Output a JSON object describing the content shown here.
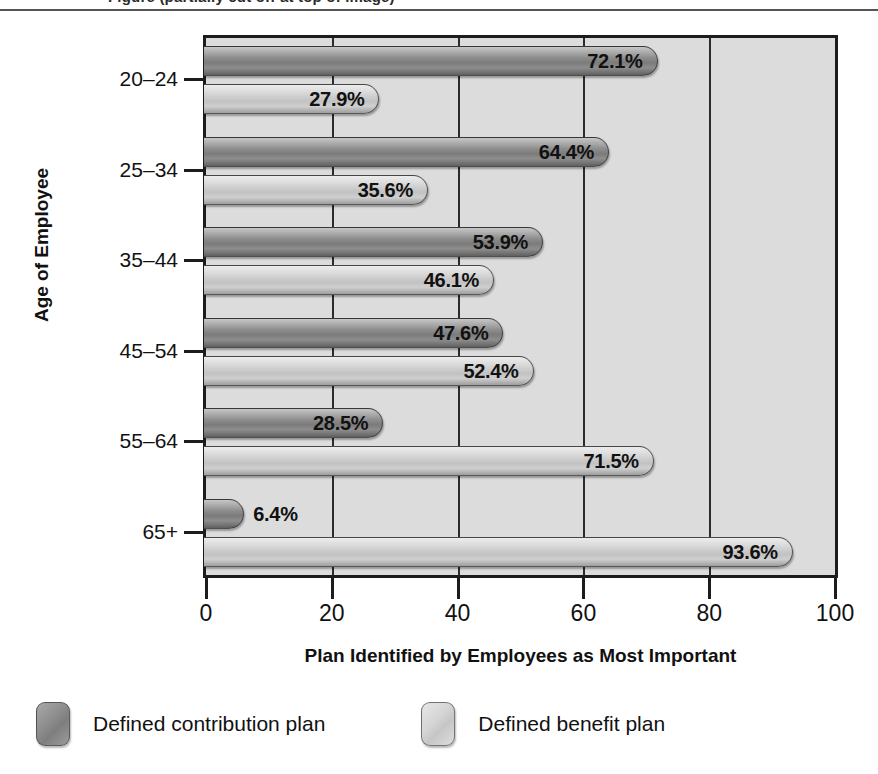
{
  "title": "Figure (partially cut off at top of image)",
  "chart_data": {
    "type": "bar",
    "orientation": "horizontal",
    "title": "",
    "xlabel": "Plan Identified by Employees as Most Important",
    "ylabel": "Age of Employee",
    "categories": [
      "20–24",
      "25–34",
      "35–44",
      "45–54",
      "55–64",
      "65+"
    ],
    "xlim": [
      0,
      100
    ],
    "xticks": [
      0,
      20,
      40,
      60,
      80,
      100
    ],
    "xtick_labels": [
      "0",
      "20",
      "40",
      "60",
      "80",
      "100"
    ],
    "grid": "vertical gridlines at 20, 40, 60, 80",
    "legend_position": "below plot, left aligned",
    "series": [
      {
        "name": "Defined contribution plan",
        "color": "#8e8e8e",
        "values": [
          72.1,
          64.4,
          53.9,
          47.6,
          28.5,
          6.4
        ],
        "labels": [
          "72.1%",
          "64.4%",
          "53.9%",
          "47.6%",
          "28.5%",
          "6.4%"
        ]
      },
      {
        "name": "Defined benefit plan",
        "color": "#cfcfcf",
        "values": [
          27.9,
          35.6,
          46.1,
          52.4,
          71.5,
          93.6
        ],
        "labels": [
          "27.9%",
          "35.6%",
          "46.1%",
          "52.4%",
          "71.5%",
          "93.6%"
        ]
      }
    ]
  },
  "legend": {
    "items": [
      {
        "label": "Defined contribution plan",
        "swatch": "dark"
      },
      {
        "label": "Defined benefit plan",
        "swatch": "light"
      }
    ]
  },
  "colors": {
    "plot_background": "#dcdcdc",
    "frame": "#1c1c1c",
    "gridline": "#2b2b2b",
    "series_dark": "#8e8e8e",
    "series_light": "#cfcfcf",
    "text": "#111111",
    "page_background": "#ffffff"
  }
}
